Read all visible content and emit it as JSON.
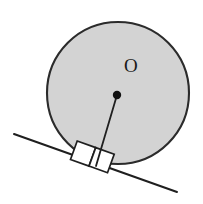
{
  "figure": {
    "kind": "geometry-diagram",
    "background_color": "#ffffff",
    "canvas": {
      "width": 203,
      "height": 204
    },
    "circle": {
      "name": "wheel",
      "center_x": 118,
      "center_y": 93,
      "radius": 71,
      "fill_color": "#d3d3d3",
      "stroke_color": "#2b2b2b",
      "stroke_width": 2.1
    },
    "center_point": {
      "name": "center-O",
      "x": 117,
      "y": 95,
      "radius": 4.2,
      "color": "#111111"
    },
    "center_label": {
      "text": "O",
      "x": 126,
      "y": 67,
      "color": "#1a1a1a",
      "font_size": 19
    },
    "radius_line": {
      "name": "radius-to-tangent-point",
      "x1": 117,
      "y1": 95,
      "x2": 96,
      "y2": 166,
      "stroke_color": "#1f1f1f",
      "stroke_width": 1.8
    },
    "incline_line": {
      "name": "inclined-ground",
      "x1": 14,
      "y1": 134,
      "x2": 177,
      "y2": 192,
      "stroke_color": "#1f1f1f",
      "stroke_width": 2.0,
      "angle_degrees": 19.6
    },
    "right_angle_markers": [
      {
        "name": "right-angle-left",
        "points": "77.2,141.0 95.7,147.6 89.0,166.1 70.5,159.5",
        "stroke_color": "#1f1f1f",
        "stroke_width": 1.7,
        "fill": "#ffffff"
      },
      {
        "name": "right-angle-right",
        "points": "95.7,147.6 114.2,154.2 107.5,172.7 89.0,166.1",
        "stroke_color": "#1f1f1f",
        "stroke_width": 1.7,
        "fill": "#ffffff"
      }
    ]
  }
}
